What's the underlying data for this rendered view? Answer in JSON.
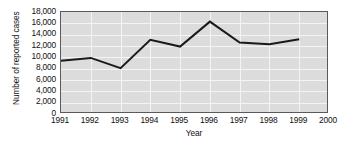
{
  "chart_data": {
    "type": "line",
    "title": "",
    "xlabel": "Year",
    "ylabel": "Number of reported cases",
    "x": [
      1991,
      1992,
      1993,
      1994,
      1995,
      1996,
      1997,
      1998,
      1999
    ],
    "series": [
      {
        "name": "Reported cases",
        "values": [
          9400,
          9900,
          8100,
          13100,
          11900,
          16300,
          12600,
          12300,
          13200
        ]
      }
    ],
    "xlim": [
      1991,
      2000
    ],
    "ylim": [
      0,
      18000
    ],
    "x_tick_labels": [
      "1991",
      "1992",
      "1993",
      "1994",
      "1995",
      "1996",
      "1997",
      "1998",
      "1999",
      "2000"
    ],
    "x_ticks": [
      1991,
      1992,
      1993,
      1994,
      1995,
      1996,
      1997,
      1998,
      1999,
      2000
    ],
    "y_tick_labels": [
      "18,000",
      "16,000",
      "14,000",
      "12,000",
      "10,000",
      "8,000",
      "6,000",
      "4,000",
      "2,000",
      "0"
    ],
    "y_ticks": [
      18000,
      16000,
      14000,
      12000,
      10000,
      8000,
      6000,
      4000,
      2000,
      0
    ],
    "grid": true,
    "legend": "none",
    "colors": {
      "plot_background": "#dcdcdc",
      "gridline": "#f4f4f4",
      "axis_frame": "#5a5a5a",
      "line": "#1a1a1a",
      "text": "#111111",
      "page_background": "#ffffff"
    },
    "line_width": 2
  }
}
